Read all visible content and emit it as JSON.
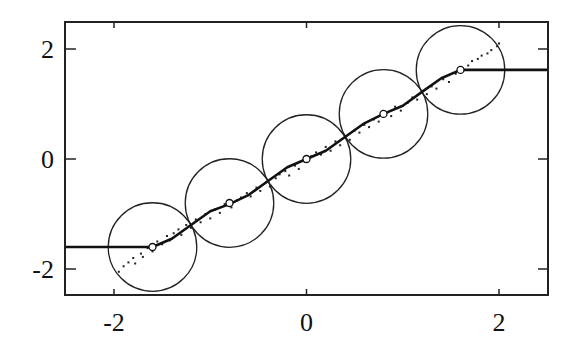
{
  "chart_data": {
    "type": "scatter",
    "title": "",
    "xlabel": "",
    "ylabel": "",
    "xlim": [
      -2.5,
      2.5
    ],
    "ylim": [
      -2.5,
      2.5
    ],
    "grid": false,
    "legend": null,
    "x_ticks": [
      -2,
      0,
      2
    ],
    "x_tick_labels": [
      "-2",
      "0",
      "2"
    ],
    "y_ticks": [
      -2,
      0,
      2
    ],
    "y_tick_labels": [
      "-2",
      "0",
      "2"
    ],
    "centers": [
      {
        "x": -1.6,
        "y": -1.6
      },
      {
        "x": -0.8,
        "y": -0.8
      },
      {
        "x": 0.0,
        "y": 0.0
      },
      {
        "x": 0.8,
        "y": 0.82
      },
      {
        "x": 1.6,
        "y": 1.62
      }
    ],
    "circle_radius_x": 0.46,
    "circle_radius_y": 0.8,
    "series": [
      {
        "name": "fitted-curve",
        "style": "line",
        "description": "piecewise staircase-like smooth curve, flat at -1.6 for x<-1.6 and flat at 1.62 for x>1.6",
        "x": [
          -2.5,
          -1.6,
          -1.4,
          -1.2,
          -1.0,
          -0.8,
          -0.6,
          -0.4,
          -0.2,
          0.0,
          0.2,
          0.4,
          0.6,
          0.8,
          1.0,
          1.2,
          1.4,
          1.6,
          2.5
        ],
        "y": [
          -1.6,
          -1.6,
          -1.45,
          -1.2,
          -0.95,
          -0.82,
          -0.65,
          -0.4,
          -0.15,
          0.0,
          0.15,
          0.4,
          0.65,
          0.82,
          0.97,
          1.22,
          1.47,
          1.62,
          1.62
        ]
      },
      {
        "name": "data-points",
        "style": "scatter",
        "description": "noisy samples along y≈x between x=-2 and x=2",
        "x": [
          -1.95,
          -1.9,
          -1.85,
          -1.8,
          -1.78,
          -1.72,
          -1.7,
          -1.65,
          -1.6,
          -1.55,
          -1.5,
          -1.45,
          -1.42,
          -1.38,
          -1.33,
          -1.3,
          -1.25,
          -1.2,
          -1.15,
          -1.1,
          -1.05,
          -1.0,
          -0.95,
          -0.9,
          -0.85,
          -0.78,
          -0.72,
          -0.68,
          -0.62,
          -0.58,
          -0.52,
          -0.48,
          -0.42,
          -0.38,
          -0.32,
          -0.28,
          -0.22,
          -0.18,
          -0.12,
          -0.08,
          -0.02,
          0.05,
          0.1,
          0.15,
          0.2,
          0.25,
          0.3,
          0.35,
          0.4,
          0.45,
          0.5,
          0.55,
          0.6,
          0.65,
          0.7,
          0.75,
          0.82,
          0.88,
          0.92,
          0.98,
          1.05,
          1.1,
          1.15,
          1.2,
          1.25,
          1.3,
          1.35,
          1.42,
          1.48,
          1.55,
          1.62,
          1.68,
          1.72,
          1.78,
          1.82,
          1.88,
          1.92,
          1.98,
          2.0
        ],
        "y": [
          -2.05,
          -1.95,
          -1.88,
          -1.8,
          -1.9,
          -1.72,
          -1.78,
          -1.62,
          -1.68,
          -1.5,
          -1.55,
          -1.4,
          -1.48,
          -1.35,
          -1.28,
          -1.38,
          -1.2,
          -1.25,
          -1.1,
          -1.15,
          -1.0,
          -1.08,
          -0.92,
          -0.98,
          -0.82,
          -0.88,
          -0.75,
          -0.7,
          -0.62,
          -0.68,
          -0.52,
          -0.58,
          -0.42,
          -0.5,
          -0.35,
          -0.28,
          -0.22,
          -0.3,
          -0.12,
          -0.18,
          -0.05,
          0.05,
          0.12,
          0.08,
          0.22,
          0.15,
          0.32,
          0.25,
          0.42,
          0.35,
          0.52,
          0.48,
          0.62,
          0.58,
          0.72,
          0.68,
          0.85,
          0.78,
          0.95,
          0.88,
          1.02,
          1.12,
          1.08,
          1.22,
          1.18,
          1.32,
          1.28,
          1.45,
          1.4,
          1.55,
          1.65,
          1.7,
          1.78,
          1.82,
          1.88,
          1.92,
          1.98,
          2.05,
          2.1
        ]
      }
    ]
  }
}
